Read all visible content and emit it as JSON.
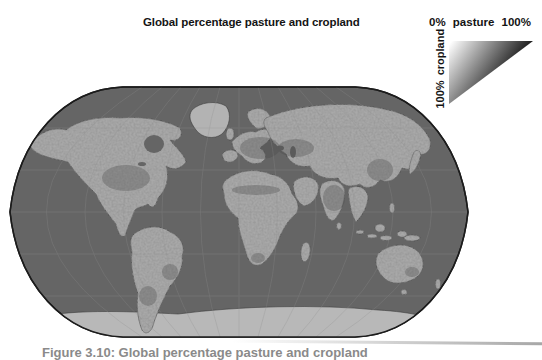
{
  "figure": {
    "title": "Global percentage pasture and cropland",
    "caption": "Figure 3.10: Global percentage pasture and cropland",
    "caption_truncated": true
  },
  "legend": {
    "pasture_label": "0% pasture 100%",
    "cropland_label": "100% cropland",
    "gradient_light_color": "#ffffff",
    "gradient_dark_color": "#060606"
  },
  "map": {
    "ocean_color": "#656565",
    "land_color": "#a9a9a9",
    "polar_ice_color": "#b8b8b8",
    "outline_color": "#1c1c1c",
    "graticule_color": "#8f8f8f"
  }
}
